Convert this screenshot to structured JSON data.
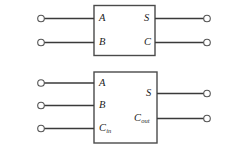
{
  "figure": {
    "background_color": "#ffffff",
    "line_color": "#3a3a3a",
    "block_stroke_color": "#4a4a4a",
    "width": 234,
    "height": 149
  },
  "blocks": [
    {
      "id": "half-adder",
      "inputs": [
        {
          "label": "A",
          "subscript": ""
        },
        {
          "label": "B",
          "subscript": ""
        }
      ],
      "outputs": [
        {
          "label": "S",
          "subscript": ""
        },
        {
          "label": "C",
          "subscript": ""
        }
      ]
    },
    {
      "id": "full-adder",
      "inputs": [
        {
          "label": "A",
          "subscript": ""
        },
        {
          "label": "B",
          "subscript": ""
        },
        {
          "label": "C",
          "subscript": "in"
        }
      ],
      "outputs": [
        {
          "label": "S",
          "subscript": ""
        },
        {
          "label": "C",
          "subscript": "out"
        }
      ]
    }
  ]
}
